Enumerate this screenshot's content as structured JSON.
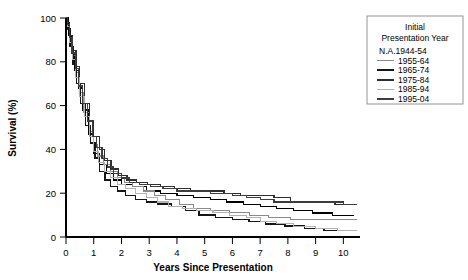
{
  "chart_data": {
    "type": "line",
    "title": "",
    "xlabel": "Years Since Presentation",
    "ylabel": "Survival (%)",
    "xlim": [
      0,
      10.6
    ],
    "ylim": [
      0,
      100
    ],
    "xticks": [
      0,
      1,
      2,
      3,
      4,
      5,
      6,
      7,
      8,
      9,
      10
    ],
    "xtick_labels": [
      "0",
      "1",
      "2",
      "3",
      "4",
      "5",
      "6",
      "7",
      "8",
      "9",
      "10"
    ],
    "yticks": [
      0,
      20,
      40,
      60,
      80,
      100
    ],
    "ytick_labels": [
      "0",
      "20",
      "40",
      "60",
      "80",
      "100"
    ],
    "grid": false,
    "step_type": "kaplan-meier",
    "legend_position": "right-outside",
    "legend_title_line1": "Initial",
    "legend_title_line2": "Presentation Year",
    "series": [
      {
        "name": "N.A.1944-54",
        "color": "#000000",
        "width": 0,
        "show_swatch": false,
        "points": [
          [
            0,
            100
          ],
          [
            0.05,
            100
          ],
          [
            0.1,
            92
          ],
          [
            0.2,
            84
          ],
          [
            0.3,
            76
          ],
          [
            0.45,
            68
          ],
          [
            0.6,
            58
          ],
          [
            0.8,
            47
          ],
          [
            1.0,
            38
          ],
          [
            1.2,
            33
          ],
          [
            1.45,
            29
          ],
          [
            1.7,
            26
          ],
          [
            2.0,
            24
          ],
          [
            2.4,
            23
          ],
          [
            2.9,
            21
          ],
          [
            3.4,
            20
          ],
          [
            4.0,
            19
          ],
          [
            4.6,
            18
          ],
          [
            5.2,
            17
          ],
          [
            5.8,
            16
          ],
          [
            6.4,
            15
          ],
          [
            7.0,
            14
          ],
          [
            7.6,
            13
          ],
          [
            8.2,
            12
          ],
          [
            8.9,
            11
          ],
          [
            9.6,
            10
          ],
          [
            10.4,
            10
          ]
        ]
      },
      {
        "name": "1955-64",
        "color": "#8a8a8a",
        "width": 1.1,
        "show_swatch": true,
        "points": [
          [
            0,
            100
          ],
          [
            0.05,
            97
          ],
          [
            0.12,
            90
          ],
          [
            0.22,
            83
          ],
          [
            0.34,
            75
          ],
          [
            0.5,
            66
          ],
          [
            0.65,
            57
          ],
          [
            0.85,
            48
          ],
          [
            1.0,
            42
          ],
          [
            1.15,
            37
          ],
          [
            1.35,
            33
          ],
          [
            1.6,
            30
          ],
          [
            1.85,
            27
          ],
          [
            2.1,
            25
          ],
          [
            2.4,
            23
          ],
          [
            2.8,
            21
          ],
          [
            3.2,
            19
          ],
          [
            3.6,
            17
          ],
          [
            4.1,
            15
          ],
          [
            4.6,
            13
          ],
          [
            5.2,
            12
          ],
          [
            5.9,
            11
          ],
          [
            6.6,
            10
          ],
          [
            7.3,
            9
          ],
          [
            8.1,
            8
          ],
          [
            9.0,
            8
          ],
          [
            10.0,
            8
          ],
          [
            10.5,
            8
          ]
        ]
      },
      {
        "name": "1965-74",
        "color": "#161616",
        "width": 1.35,
        "show_swatch": true,
        "points": [
          [
            0,
            100
          ],
          [
            0.06,
            95
          ],
          [
            0.14,
            87
          ],
          [
            0.25,
            79
          ],
          [
            0.38,
            70
          ],
          [
            0.52,
            61
          ],
          [
            0.7,
            51
          ],
          [
            0.88,
            43
          ],
          [
            1.05,
            36
          ],
          [
            1.2,
            30
          ],
          [
            1.4,
            26
          ],
          [
            1.6,
            23
          ],
          [
            1.85,
            21
          ],
          [
            2.15,
            19
          ],
          [
            2.5,
            17
          ],
          [
            2.9,
            16
          ],
          [
            3.3,
            15
          ],
          [
            3.8,
            14
          ],
          [
            4.3,
            12
          ],
          [
            4.8,
            10
          ],
          [
            5.4,
            9
          ],
          [
            6.0,
            8
          ],
          [
            6.6,
            7
          ],
          [
            7.2,
            6
          ],
          [
            7.9,
            5
          ],
          [
            8.6,
            4
          ],
          [
            9.3,
            3
          ],
          [
            10.0,
            3
          ],
          [
            10.5,
            3
          ]
        ]
      },
      {
        "name": "1975-84",
        "color": "#2e2e2e",
        "width": 1.25,
        "show_swatch": true,
        "points": [
          [
            0,
            100
          ],
          [
            0.05,
            98
          ],
          [
            0.13,
            92
          ],
          [
            0.24,
            85
          ],
          [
            0.36,
            78
          ],
          [
            0.5,
            70
          ],
          [
            0.68,
            61
          ],
          [
            0.85,
            53
          ],
          [
            1.0,
            46
          ],
          [
            1.2,
            40
          ],
          [
            1.4,
            35
          ],
          [
            1.62,
            31
          ],
          [
            1.9,
            28
          ],
          [
            2.2,
            26
          ],
          [
            2.55,
            25
          ],
          [
            2.95,
            24
          ],
          [
            3.4,
            23
          ],
          [
            3.9,
            22
          ],
          [
            4.5,
            21
          ],
          [
            5.1,
            21
          ],
          [
            5.7,
            20
          ],
          [
            6.3,
            19
          ],
          [
            6.9,
            19
          ],
          [
            7.5,
            18
          ],
          [
            8.0,
            18
          ],
          [
            8.1,
            16
          ],
          [
            8.9,
            16
          ],
          [
            9.5,
            16
          ],
          [
            9.7,
            15
          ],
          [
            10.5,
            15
          ]
        ]
      },
      {
        "name": "1985-94",
        "color": "#b2b2b2",
        "width": 1.1,
        "show_swatch": true,
        "points": [
          [
            0,
            100
          ],
          [
            0.05,
            96
          ],
          [
            0.13,
            89
          ],
          [
            0.23,
            81
          ],
          [
            0.35,
            73
          ],
          [
            0.5,
            64
          ],
          [
            0.66,
            55
          ],
          [
            0.84,
            46
          ],
          [
            1.0,
            39
          ],
          [
            1.18,
            34
          ],
          [
            1.38,
            30
          ],
          [
            1.6,
            27
          ],
          [
            1.85,
            24
          ],
          [
            2.15,
            22
          ],
          [
            2.5,
            20
          ],
          [
            2.9,
            18
          ],
          [
            3.3,
            16
          ],
          [
            3.7,
            14
          ],
          [
            4.2,
            13
          ],
          [
            4.7,
            12
          ],
          [
            5.3,
            11
          ],
          [
            5.9,
            10
          ],
          [
            6.5,
            9
          ],
          [
            7.0,
            7
          ],
          [
            7.6,
            6
          ],
          [
            8.2,
            5
          ],
          [
            9.0,
            4
          ],
          [
            9.8,
            3
          ],
          [
            10.5,
            3
          ]
        ]
      },
      {
        "name": "1995-04",
        "color": "#3d3d3d",
        "width": 1.3,
        "show_swatch": true,
        "points": [
          [
            0,
            100
          ],
          [
            0.05,
            97
          ],
          [
            0.12,
            91
          ],
          [
            0.22,
            84
          ],
          [
            0.33,
            77
          ],
          [
            0.46,
            69
          ],
          [
            0.6,
            61
          ],
          [
            0.78,
            53
          ],
          [
            0.95,
            46
          ],
          [
            1.1,
            41
          ],
          [
            1.3,
            36
          ],
          [
            1.5,
            32
          ],
          [
            1.72,
            29
          ],
          [
            2.0,
            27
          ],
          [
            2.3,
            25
          ],
          [
            2.65,
            24
          ],
          [
            3.05,
            23
          ],
          [
            3.5,
            22
          ],
          [
            4.0,
            21
          ],
          [
            4.6,
            21
          ],
          [
            5.2,
            20
          ],
          [
            5.7,
            20
          ],
          [
            6.0,
            19
          ],
          [
            6.5,
            18
          ],
          [
            7.0,
            17
          ],
          [
            7.5,
            16
          ],
          [
            8.0,
            16
          ],
          [
            8.5,
            16
          ],
          [
            9.0,
            16
          ],
          [
            9.6,
            16
          ],
          [
            10.0,
            15
          ],
          [
            10.5,
            15
          ]
        ]
      }
    ]
  },
  "legend": {
    "title_line1": "Initial",
    "title_line2": "Presentation Year",
    "entries": [
      {
        "label": "N.A.1944-54"
      },
      {
        "label": "1955-64"
      },
      {
        "label": "1965-74"
      },
      {
        "label": "1975-84"
      },
      {
        "label": "1985-94"
      },
      {
        "label": "1995-04"
      }
    ]
  },
  "axes": {
    "x_title": "Years Since Presentation",
    "y_title": "Survival (%)"
  }
}
